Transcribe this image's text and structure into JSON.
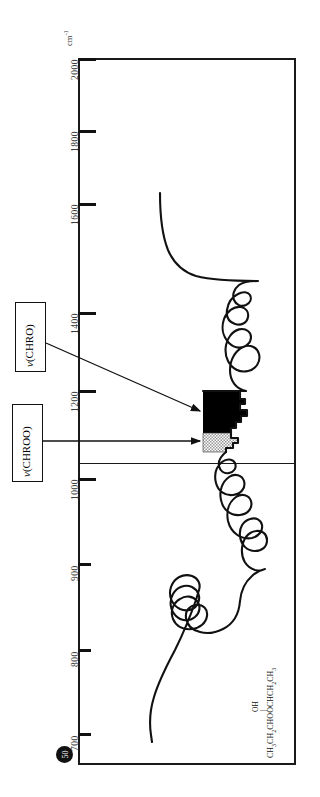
{
  "axis": {
    "unit_label": "cm",
    "unit_exponent": "-1",
    "ticks": [
      {
        "label": "2000",
        "y": 58
      },
      {
        "label": "1800",
        "y": 130
      },
      {
        "label": "1600",
        "y": 203
      },
      {
        "label": "1400",
        "y": 312
      },
      {
        "label": "1200",
        "y": 390
      },
      {
        "label": "1000",
        "y": 478
      },
      {
        "label": "900",
        "y": 563
      },
      {
        "label": "800",
        "y": 649
      },
      {
        "label": "700",
        "y": 733
      }
    ]
  },
  "annotations": [
    {
      "name": "chro",
      "symbol": "ν",
      "text": "(CHRO)"
    },
    {
      "name": "chroo",
      "symbol": "ν",
      "text": "(CHROO)"
    }
  ],
  "formula": {
    "main": "CH3CH2CHOOCHCH2CH3",
    "substituent": "OH",
    "bond": "|"
  },
  "page_number": "50",
  "colors": {
    "ink": "#111111",
    "frame": "#1a1a1a",
    "label": "#3a3a3a",
    "peak_solid": "#000000",
    "peak_hatch": "#b4b4b4"
  },
  "chart_data": {
    "type": "line",
    "title": "",
    "xlabel": "cm-1",
    "ylabel": "Transmittance",
    "orientation": "rotated-90",
    "axis_ticks": [
      2000,
      1800,
      1600,
      1400,
      1200,
      1000,
      900,
      800,
      700
    ],
    "axis_range": [
      2000,
      680
    ],
    "scale_change_at": 1000,
    "grid": false,
    "legend": "none",
    "series": [
      {
        "name": "IR transmittance trace",
        "points": [
          [
            1645,
            0.62
          ],
          [
            1630,
            0.55
          ],
          [
            1610,
            0.44
          ],
          [
            1580,
            0.33
          ],
          [
            1545,
            0.24
          ],
          [
            1505,
            0.18
          ],
          [
            1470,
            0.145
          ],
          [
            1455,
            0.145
          ],
          [
            1430,
            0.143
          ],
          [
            1400,
            0.142
          ],
          [
            1375,
            0.142
          ],
          [
            1350,
            0.142
          ],
          [
            1332,
            0.3
          ],
          [
            1325,
            0.22
          ],
          [
            1315,
            0.31
          ],
          [
            1305,
            0.24
          ],
          [
            1290,
            0.45
          ],
          [
            1275,
            0.5
          ],
          [
            1262,
            0.36
          ],
          [
            1250,
            0.37
          ],
          [
            1240,
            0.38
          ],
          [
            1225,
            0.33
          ],
          [
            1210,
            0.28
          ],
          [
            1195,
            0.32
          ],
          [
            1182,
            0.52
          ],
          [
            1168,
            0.47
          ],
          [
            1155,
            0.56
          ],
          [
            1142,
            0.44
          ],
          [
            1128,
            0.57
          ],
          [
            1115,
            0.5
          ],
          [
            1100,
            0.58
          ],
          [
            1088,
            0.44
          ],
          [
            1072,
            0.46
          ],
          [
            1058,
            0.4
          ],
          [
            1045,
            0.38
          ],
          [
            1032,
            0.5
          ],
          [
            1018,
            0.44
          ],
          [
            1006,
            0.47
          ],
          [
            995,
            0.41
          ],
          [
            985,
            0.36
          ],
          [
            972,
            0.42
          ],
          [
            958,
            0.35
          ],
          [
            945,
            0.3
          ],
          [
            930,
            0.33
          ],
          [
            915,
            0.29
          ],
          [
            900,
            0.26
          ],
          [
            888,
            0.28
          ],
          [
            875,
            0.34
          ],
          [
            862,
            0.39
          ],
          [
            848,
            0.42
          ],
          [
            835,
            0.47
          ],
          [
            822,
            0.55
          ],
          [
            808,
            0.6
          ],
          [
            795,
            0.64
          ],
          [
            782,
            0.62
          ],
          [
            770,
            0.66
          ],
          [
            758,
            0.71
          ],
          [
            745,
            0.69
          ],
          [
            732,
            0.74
          ],
          [
            720,
            0.78
          ],
          [
            705,
            0.82
          ],
          [
            692,
            0.86
          ]
        ]
      }
    ],
    "annotated_bands": [
      {
        "label": "ν(CHRO)",
        "fill": "solid-black",
        "range_cm1": [
          1185,
          1090
        ]
      },
      {
        "label": "ν(CHROO)",
        "fill": "gray-hatch",
        "range_cm1": [
          1090,
          1035
        ]
      }
    ],
    "compound": "CH3CH2CHOOCHCH2CH3 (OH)"
  }
}
